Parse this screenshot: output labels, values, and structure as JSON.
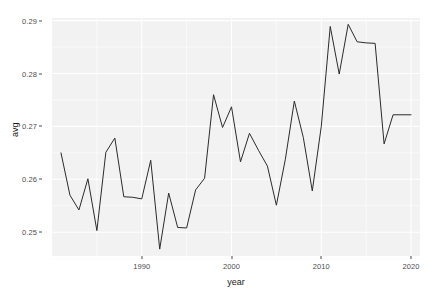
{
  "chart_data": {
    "type": "line",
    "title": "",
    "xlabel": "year",
    "ylabel": "avg",
    "xlim": [
      1980,
      2021
    ],
    "ylim": [
      0.2455,
      0.2905
    ],
    "grid": true,
    "legend": "none",
    "x_ticks": [
      1990,
      2000,
      2010,
      2020
    ],
    "x_tick_labels": [
      "1990",
      "2000",
      "2010",
      "2020"
    ],
    "y_ticks": [
      0.25,
      0.26,
      0.27,
      0.28,
      0.29
    ],
    "y_tick_labels": [
      "0.25",
      "0.26",
      "0.27",
      "0.28",
      "0.29"
    ],
    "x": [
      1981,
      1982,
      1983,
      1984,
      1985,
      1986,
      1987,
      1988,
      1989,
      1990,
      1991,
      1992,
      1993,
      1994,
      1995,
      1996,
      1997,
      1998,
      1999,
      2000,
      2001,
      2002,
      2003,
      2004,
      2005,
      2006,
      2007,
      2008,
      2009,
      2010,
      2011,
      2012,
      2013,
      2014,
      2015,
      2016,
      2017,
      2018,
      2019,
      2020
    ],
    "values": [
      0.265,
      0.257,
      0.2542,
      0.2601,
      0.2503,
      0.2651,
      0.2678,
      0.2567,
      0.2566,
      0.2563,
      0.2636,
      0.2468,
      0.2574,
      0.2509,
      0.2508,
      0.258,
      0.2602,
      0.276,
      0.2698,
      0.2737,
      0.2633,
      0.2687,
      0.2655,
      0.2625,
      0.2551,
      0.2638,
      0.2748,
      0.2679,
      0.2578,
      0.27,
      0.2889,
      0.2799,
      0.2893,
      0.286,
      0.2858,
      0.2857,
      0.2667,
      0.2722,
      0.2722,
      0.2722
    ],
    "series": [
      {
        "name": "avg",
        "color": "#2b2b2b",
        "points": [
          {
            "year": 1981,
            "value": 0.265
          },
          {
            "year": 1982,
            "value": 0.257
          },
          {
            "year": 1983,
            "value": 0.2542
          },
          {
            "year": 1984,
            "value": 0.2601
          },
          {
            "year": 1985,
            "value": 0.2503
          },
          {
            "year": 1986,
            "value": 0.2651
          },
          {
            "year": 1987,
            "value": 0.2678
          },
          {
            "year": 1988,
            "value": 0.2567
          },
          {
            "year": 1989,
            "value": 0.2566
          },
          {
            "year": 1990,
            "value": 0.2563
          },
          {
            "year": 1991,
            "value": 0.2636
          },
          {
            "year": 1992,
            "value": 0.2468
          },
          {
            "year": 1993,
            "value": 0.2574
          },
          {
            "year": 1994,
            "value": 0.2509
          },
          {
            "year": 1995,
            "value": 0.2508
          },
          {
            "year": 1996,
            "value": 0.258
          },
          {
            "year": 1997,
            "value": 0.2602
          },
          {
            "year": 1998,
            "value": 0.276
          },
          {
            "year": 1999,
            "value": 0.2698
          },
          {
            "year": 2000,
            "value": 0.2737
          },
          {
            "year": 2001,
            "value": 0.2633
          },
          {
            "year": 2002,
            "value": 0.2687
          },
          {
            "year": 2003,
            "value": 0.2655
          },
          {
            "year": 2004,
            "value": 0.2625
          },
          {
            "year": 2005,
            "value": 0.2551
          },
          {
            "year": 2006,
            "value": 0.2638
          },
          {
            "year": 2007,
            "value": 0.2748
          },
          {
            "year": 2008,
            "value": 0.2679
          },
          {
            "year": 2009,
            "value": 0.2578
          },
          {
            "year": 2010,
            "value": 0.27
          },
          {
            "year": 2011,
            "value": 0.2889
          },
          {
            "year": 2012,
            "value": 0.2799
          },
          {
            "year": 2013,
            "value": 0.2893
          },
          {
            "year": 2014,
            "value": 0.286
          },
          {
            "year": 2015,
            "value": 0.2858
          },
          {
            "year": 2016,
            "value": 0.2857
          },
          {
            "year": 2017,
            "value": 0.2667
          },
          {
            "year": 2018,
            "value": 0.2722
          }
        ]
      }
    ],
    "style": {
      "panel_background": "#f2f2f2",
      "major_gridline_color": "#ffffff",
      "minor_gridline_color": "#fbfbfb",
      "line_color": "#2b2b2b",
      "axis_text_color": "#4d4d4d",
      "axis_title_color": "#1a1a1a",
      "plot_background": "#ffffff"
    }
  }
}
